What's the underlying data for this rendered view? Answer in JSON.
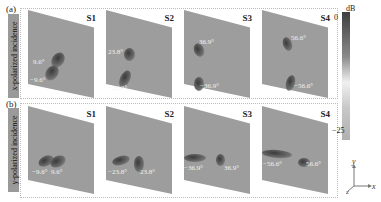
{
  "rows": [
    {
      "label": "(a)",
      "side_label": "x-polarized incidence",
      "panels": [
        {
          "title": "S1",
          "annotations": [
            "9.6°",
            "−9.6°"
          ]
        },
        {
          "title": "S2",
          "annotations": [
            "23.8°",
            "−23.8°"
          ]
        },
        {
          "title": "S3",
          "annotations": [
            "36.9°",
            "−36.9°"
          ]
        },
        {
          "title": "S4",
          "annotations": [
            "56.6°",
            "−56.6°"
          ]
        }
      ]
    },
    {
      "label": "(b)",
      "side_label": "y-polarized incidence",
      "panels": [
        {
          "title": "S1",
          "annotations": [
            "−9.6°",
            "9.6°"
          ]
        },
        {
          "title": "S2",
          "annotations": [
            "−23.8°",
            "23.8°"
          ]
        },
        {
          "title": "S3",
          "annotations": [
            "−36.9°",
            "36.9°"
          ]
        },
        {
          "title": "S4",
          "annotations": [
            "−56.6°",
            "56.6°"
          ]
        }
      ]
    }
  ],
  "colorbar": {
    "unit": "dB",
    "max": "0",
    "min": "−25"
  },
  "axes": {
    "x": "x",
    "y": "y",
    "z": "z"
  }
}
